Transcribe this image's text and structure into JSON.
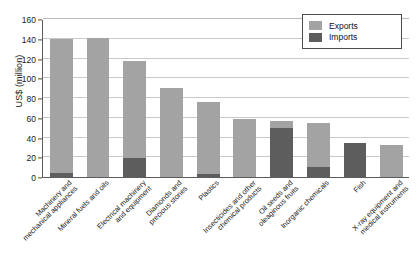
{
  "chart_data": {
    "type": "bar",
    "stacked": true,
    "title": "",
    "xlabel": "",
    "ylabel": "US$ (million)",
    "ylim": [
      0,
      160
    ],
    "ytick_step": 20,
    "yticks": [
      0,
      20,
      40,
      60,
      80,
      100,
      120,
      140,
      160
    ],
    "grid": true,
    "legend_position": "top-right",
    "categories": [
      "Machinery and\nmechanical appliances",
      "Mineral fuels and oils",
      "Electrical machinery\nand equipment",
      "Diamonds and\nprecious stones",
      "Plastics",
      "Insecticides and other\nchemical products",
      "Oil seeds and\noleaginous fruits",
      "Inorganic chemicals",
      "Fish",
      "X-ray equipment and\nmedical instruments"
    ],
    "series": [
      {
        "name": "Exports",
        "color": "#a3a3a3",
        "values": [
          136,
          141,
          99,
          90,
          73,
          59,
          7,
          45,
          0,
          32
        ]
      },
      {
        "name": "Imports",
        "color": "#5d5d5d",
        "values": [
          4,
          0,
          19,
          0,
          3,
          0,
          50,
          10,
          34,
          0
        ]
      }
    ],
    "totals": [
      140,
      141,
      118,
      90,
      76,
      59,
      57,
      55,
      34,
      32
    ]
  },
  "legend": {
    "items": [
      {
        "label": "Exports",
        "swatch": "exports"
      },
      {
        "label": "Imports",
        "swatch": "imports"
      }
    ]
  },
  "axis": {
    "y_title": "US$ (million)"
  }
}
